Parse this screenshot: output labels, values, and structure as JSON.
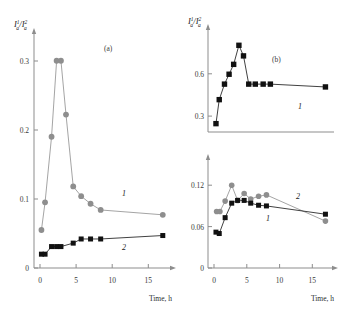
{
  "figure": {
    "background": "#ffffff",
    "marker_gray": "#8e8e8e",
    "marker_black": "#111111",
    "axis_color": "#8d8d8d"
  },
  "axis_titles": {
    "x": "Time, h",
    "y_numer": "I",
    "y_numer_sup": "1",
    "y_numer_sub": "a",
    "y_denom": "I",
    "y_denom_sup": "2",
    "y_denom_sub": "a",
    "y_slash": "/"
  },
  "panels": {
    "a": {
      "label": "(a)"
    },
    "b": {
      "label": "(b)"
    }
  },
  "series_tags": {
    "one": "1",
    "two": "2"
  },
  "ticks": {
    "panel_a_y": [
      "0",
      "0.1",
      "0.2",
      "0.3"
    ],
    "panel_a_x": [
      "0",
      "5",
      "10",
      "15"
    ],
    "panel_b_top_y": [
      "0.3",
      "0.6"
    ],
    "panel_b_bot_y": [
      "0",
      "0.06",
      "0.12"
    ],
    "panel_b_x": [
      "0",
      "5",
      "10",
      "15"
    ]
  },
  "chart_data": [
    {
      "id": "panel-a",
      "type": "line",
      "title": "(a)",
      "xlabel": "Time, h",
      "ylabel": "I_a^1 / I_a^2",
      "xlim": [
        0,
        18
      ],
      "ylim": [
        0,
        0.33
      ],
      "xticks": [
        0,
        5,
        10,
        15
      ],
      "yticks": [
        0,
        0.1,
        0.2,
        0.3
      ],
      "grid": false,
      "legend": "inline-curve-labels",
      "series": [
        {
          "name": "1",
          "marker": "circle",
          "color": "#8e8e8e",
          "x": [
            0.2,
            0.7,
            1.6,
            2.3,
            2.9,
            3.6,
            4.6,
            5.7,
            7.0,
            8.4,
            17.0
          ],
          "y": [
            0.055,
            0.095,
            0.19,
            0.3,
            0.3,
            0.222,
            0.118,
            0.104,
            0.093,
            0.084,
            0.077
          ]
        },
        {
          "name": "2",
          "marker": "square",
          "color": "#111111",
          "x": [
            0.2,
            0.7,
            1.6,
            2.3,
            2.9,
            4.6,
            5.7,
            7.0,
            8.4,
            17.0
          ],
          "y": [
            0.02,
            0.02,
            0.031,
            0.031,
            0.031,
            0.036,
            0.042,
            0.042,
            0.042,
            0.047
          ]
        }
      ]
    },
    {
      "id": "panel-b-top",
      "type": "line",
      "title": "(b)",
      "xlabel": "Time, h",
      "ylabel": "I_a^1 / I_a^2",
      "xlim": [
        0,
        18
      ],
      "ylim": [
        0.1,
        0.78
      ],
      "xticks": [
        0,
        5,
        10,
        15
      ],
      "yticks": [
        0.3,
        0.6
      ],
      "grid": false,
      "series": [
        {
          "name": "1",
          "marker": "square",
          "color": "#111111",
          "x": [
            0.3,
            0.8,
            1.6,
            2.3,
            3.0,
            3.8,
            4.5,
            5.3,
            6.3,
            7.5,
            8.6,
            17.0
          ],
          "y": [
            0.145,
            0.315,
            0.425,
            0.495,
            0.565,
            0.7,
            0.625,
            0.425,
            0.425,
            0.425,
            0.425,
            0.405
          ]
        }
      ]
    },
    {
      "id": "panel-b-bottom",
      "type": "line",
      "xlabel": "Time, h",
      "xlim": [
        0,
        18
      ],
      "ylim": [
        0,
        0.145
      ],
      "xticks": [
        0,
        5,
        10,
        15
      ],
      "yticks": [
        0,
        0.06,
        0.12
      ],
      "grid": false,
      "series": [
        {
          "name": "1",
          "marker": "square",
          "color": "#111111",
          "x": [
            0.3,
            0.8,
            1.7,
            2.7,
            3.6,
            4.6,
            5.6,
            6.8,
            8.0,
            17.0
          ],
          "y": [
            0.052,
            0.05,
            0.073,
            0.094,
            0.098,
            0.098,
            0.094,
            0.091,
            0.09,
            0.078
          ]
        },
        {
          "name": "2",
          "marker": "circle",
          "color": "#8e8e8e",
          "x": [
            0.4,
            0.9,
            1.7,
            2.7,
            3.6,
            4.6,
            5.6,
            6.8,
            8.0,
            17.0
          ],
          "y": [
            0.082,
            0.082,
            0.097,
            0.12,
            0.098,
            0.108,
            0.1,
            0.104,
            0.106,
            0.068
          ]
        }
      ]
    }
  ]
}
